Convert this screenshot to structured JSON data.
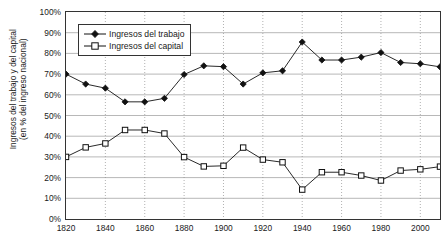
{
  "chart_data": {
    "type": "line",
    "title": "",
    "xlabel": "",
    "ylabel": "Ingresos del trabajo y del capital\n(en % del ingreso nacional)",
    "ylabel_line1": "Ingresos del trabajo y del capital",
    "ylabel_line2": "(en % del ingreso nacional)",
    "x": [
      1820,
      1830,
      1840,
      1850,
      1860,
      1870,
      1880,
      1890,
      1900,
      1910,
      1920,
      1930,
      1940,
      1950,
      1960,
      1970,
      1980,
      1990,
      2000,
      2010
    ],
    "xtick_labels": [
      "1820",
      "1840",
      "1860",
      "1880",
      "1900",
      "1920",
      "1940",
      "1960",
      "1980",
      "2000"
    ],
    "xtick_values": [
      1820,
      1840,
      1860,
      1880,
      1900,
      1920,
      1940,
      1960,
      1980,
      2000
    ],
    "ytick_labels": [
      "0%",
      "10%",
      "20%",
      "30%",
      "40%",
      "50%",
      "60%",
      "70%",
      "80%",
      "90%",
      "100%"
    ],
    "ytick_values": [
      0,
      10,
      20,
      30,
      40,
      50,
      60,
      70,
      80,
      90,
      100
    ],
    "xlim": [
      1820,
      2010
    ],
    "ylim": [
      0,
      100
    ],
    "grid": true,
    "grid_major_axis": "y",
    "grid_minor_axis": "x",
    "legend_position": "top-left",
    "series": [
      {
        "name": "Ingresos del trabajo",
        "marker": "filled-diamond",
        "color": "#111111",
        "values": [
          70.0,
          65.2,
          63.2,
          56.6,
          56.6,
          58.3,
          69.8,
          74.0,
          73.6,
          65.2,
          70.6,
          71.6,
          85.5,
          76.8,
          76.8,
          78.2,
          80.4,
          75.6,
          75.0,
          73.5
        ]
      },
      {
        "name": "Ingresos del capital",
        "marker": "open-square",
        "color": "#111111",
        "values": [
          30.0,
          34.6,
          36.5,
          43.0,
          43.0,
          41.3,
          29.9,
          25.4,
          25.7,
          34.5,
          28.7,
          27.4,
          14.2,
          22.6,
          22.6,
          21.0,
          18.6,
          23.4,
          24.0,
          25.3
        ]
      }
    ]
  }
}
